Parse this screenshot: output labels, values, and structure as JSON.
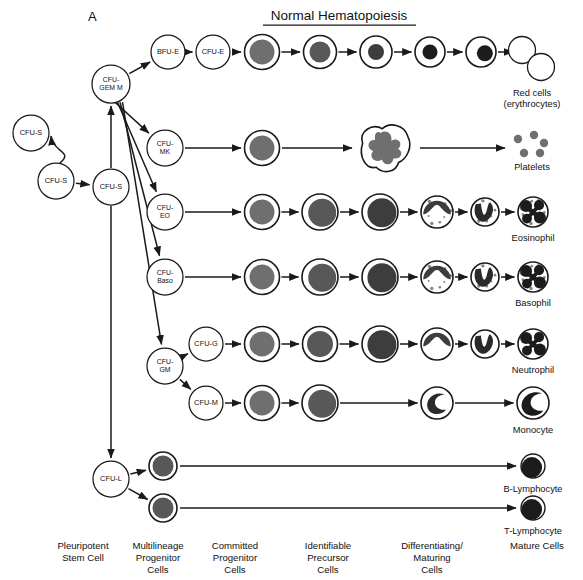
{
  "panel": {
    "tag": "A",
    "title": "Normal Hematopoiesis"
  },
  "colors": {
    "ink": "#1a1a1a",
    "nucleus_light": "#6f6f6f",
    "nucleus_mid": "#585858",
    "nucleus_dark": "#3d3d3d",
    "nucleus_darker": "#2a2a2a",
    "nucleus_black": "#1c1c1c",
    "cytoplasm": "#ffffff",
    "platelet": "#6f6f6f"
  },
  "column_labels": [
    {
      "id": "pleuripotent",
      "lines": [
        "Pleuripotent",
        "Stem Cell"
      ],
      "x": 83
    },
    {
      "id": "multilineage",
      "lines": [
        "Multilineage",
        "Progenitor",
        "Cells"
      ],
      "x": 158
    },
    {
      "id": "committed",
      "lines": [
        "Committed",
        "Progenitor",
        "Cells"
      ],
      "x": 235
    },
    {
      "id": "identifiable",
      "lines": [
        "Identifiable",
        "Precursor",
        "Cells"
      ],
      "x": 328
    },
    {
      "id": "differentiating",
      "lines": [
        "Differentiating/",
        "Maturing",
        "Cells"
      ],
      "x": 432
    },
    {
      "id": "mature",
      "lines": [
        "Mature Cells"
      ],
      "x": 537
    }
  ],
  "progenitor_nodes": [
    {
      "id": "cfu-s-renew",
      "lines": [
        "CFU-S"
      ],
      "cx": 31,
      "cy": 133,
      "r": 18
    },
    {
      "id": "cfu-s-mid",
      "lines": [
        "CFU-S"
      ],
      "cx": 56,
      "cy": 181,
      "r": 18
    },
    {
      "id": "cfu-s-main",
      "lines": [
        "CFU-S"
      ],
      "cx": 111,
      "cy": 187,
      "r": 18
    },
    {
      "id": "cfu-gemm",
      "lines": [
        "CFU-",
        "GEM M"
      ],
      "cx": 111,
      "cy": 84,
      "r": 19
    },
    {
      "id": "bfu-e",
      "lines": [
        "BFU-E"
      ],
      "cx": 168,
      "cy": 52,
      "r": 17
    },
    {
      "id": "cfu-e",
      "lines": [
        "CFU-E"
      ],
      "cx": 213,
      "cy": 52,
      "r": 17
    },
    {
      "id": "cfu-mk",
      "lines": [
        "CFU-",
        "MK"
      ],
      "cx": 165,
      "cy": 148,
      "r": 18
    },
    {
      "id": "cfu-eo",
      "lines": [
        "CFU-",
        "EO"
      ],
      "cx": 165,
      "cy": 212,
      "r": 18
    },
    {
      "id": "cfu-baso",
      "lines": [
        "CFU-",
        "Baso"
      ],
      "cx": 165,
      "cy": 277,
      "r": 18
    },
    {
      "id": "cfu-gm",
      "lines": [
        "CFU-",
        "GM"
      ],
      "cx": 165,
      "cy": 366,
      "r": 18
    },
    {
      "id": "cfu-g",
      "lines": [
        "CFU-G"
      ],
      "cx": 206,
      "cy": 344,
      "r": 17
    },
    {
      "id": "cfu-m",
      "lines": [
        "CFU-M"
      ],
      "cx": 206,
      "cy": 403,
      "r": 17
    },
    {
      "id": "cfu-l",
      "lines": [
        "CFU-L"
      ],
      "cx": 111,
      "cy": 479,
      "r": 18
    }
  ],
  "lineages": [
    {
      "id": "erythroid",
      "name": "Erythroid",
      "end_label": [
        "Red cells",
        "(erythrocytes)"
      ],
      "row_y": 52,
      "cells": [
        {
          "id": "proerythroblast",
          "cx": 262,
          "cy": 52,
          "r": 17.5,
          "nucleus_r": 12.5,
          "tone": "nucleus_light"
        },
        {
          "id": "basophilic-erythroblast",
          "cx": 320,
          "cy": 52,
          "r": 16.5,
          "nucleus_r": 10.5,
          "tone": "nucleus_mid"
        },
        {
          "id": "polychromatic-erythroblast",
          "cx": 376,
          "cy": 52,
          "r": 16,
          "nucleus_r": 8,
          "tone": "nucleus_dark"
        },
        {
          "id": "orthochromatic-erythroblast",
          "cx": 430,
          "cy": 52,
          "r": 15,
          "nucleus_r": 7.5,
          "tone": "nucleus_black"
        },
        {
          "id": "reticulocyte",
          "cx": 481,
          "cy": 52,
          "r": 15,
          "nucleus_r": 8,
          "tone": "nucleus_black",
          "eccentric": true
        }
      ],
      "mature": {
        "id": "erythrocytes",
        "type": "rbc-pair",
        "cx": 532,
        "cy": 58,
        "label_y": 96
      }
    },
    {
      "id": "megakaryocytic",
      "name": "Megakaryocytic",
      "end_label": [
        "Platelets"
      ],
      "row_y": 148,
      "cells": [
        {
          "id": "megakaryoblast",
          "cx": 262,
          "cy": 148,
          "r": 17.5,
          "nucleus_r": 12.5,
          "tone": "nucleus_light"
        },
        {
          "id": "megakaryocyte",
          "cx": 385,
          "cy": 148,
          "type": "megakaryocyte"
        }
      ],
      "mature": {
        "id": "platelets",
        "type": "platelets",
        "cx": 532,
        "cy": 145,
        "label_y": 170
      }
    },
    {
      "id": "eosinophilic",
      "name": "Eosinophilic",
      "end_label": [
        "Eosinophil"
      ],
      "row_y": 212,
      "cells": [
        {
          "id": "eo-myeloblast",
          "cx": 262,
          "cy": 212,
          "r": 17.5,
          "nucleus_r": 12.5,
          "tone": "nucleus_light"
        },
        {
          "id": "eo-promyelocyte",
          "cx": 320,
          "cy": 212,
          "r": 18,
          "nucleus_r": 14,
          "tone": "nucleus_mid",
          "eccentric": true
        },
        {
          "id": "eo-myelocyte",
          "cx": 380,
          "cy": 212,
          "r": 18,
          "nucleus_r": 14.5,
          "tone": "nucleus_dark",
          "eccentric": true
        },
        {
          "id": "eo-metamyelocyte",
          "cx": 437,
          "cy": 212,
          "r": 16,
          "type": "indented",
          "tone": "nucleus_dark",
          "granules": true
        },
        {
          "id": "eo-band",
          "cx": 485,
          "cy": 212,
          "r": 14,
          "type": "band",
          "tone": "nucleus_darker",
          "granules": true
        }
      ],
      "mature": {
        "id": "eosinophil",
        "type": "segmented",
        "cx": 533,
        "cy": 212,
        "r": 15,
        "granules": true,
        "label_y": 241
      }
    },
    {
      "id": "basophilic",
      "name": "Basophilic",
      "end_label": [
        "Basophil"
      ],
      "row_y": 277,
      "cells": [
        {
          "id": "baso-myeloblast",
          "cx": 262,
          "cy": 277,
          "r": 17.5,
          "nucleus_r": 12.5,
          "tone": "nucleus_light"
        },
        {
          "id": "baso-promyelocyte",
          "cx": 320,
          "cy": 277,
          "r": 18,
          "nucleus_r": 14,
          "tone": "nucleus_mid",
          "eccentric": true
        },
        {
          "id": "baso-myelocyte",
          "cx": 380,
          "cy": 277,
          "r": 18,
          "nucleus_r": 14.5,
          "tone": "nucleus_dark",
          "eccentric": true
        },
        {
          "id": "baso-metamyelocyte",
          "cx": 437,
          "cy": 277,
          "r": 16,
          "type": "indented",
          "tone": "nucleus_dark",
          "granules": true
        },
        {
          "id": "baso-band",
          "cx": 485,
          "cy": 277,
          "r": 14,
          "type": "band",
          "tone": "nucleus_darker",
          "granules": true
        }
      ],
      "mature": {
        "id": "basophil",
        "type": "segmented",
        "cx": 533,
        "cy": 277,
        "r": 15,
        "granules": true,
        "label_y": 306
      }
    },
    {
      "id": "neutrophilic",
      "name": "Neutrophilic",
      "end_label": [
        "Neutrophil"
      ],
      "row_y": 344,
      "cells": [
        {
          "id": "neut-myeloblast",
          "cx": 262,
          "cy": 344,
          "r": 17.5,
          "nucleus_r": 12.5,
          "tone": "nucleus_light"
        },
        {
          "id": "neut-promyelocyte",
          "cx": 320,
          "cy": 344,
          "r": 17.5,
          "nucleus_r": 13,
          "tone": "nucleus_mid"
        },
        {
          "id": "neut-myelocyte",
          "cx": 380,
          "cy": 344,
          "r": 18,
          "nucleus_r": 14.5,
          "tone": "nucleus_dark",
          "eccentric": true
        },
        {
          "id": "neut-metamyelocyte",
          "cx": 437,
          "cy": 344,
          "r": 16,
          "type": "indented",
          "tone": "nucleus_dark"
        },
        {
          "id": "neut-band",
          "cx": 485,
          "cy": 344,
          "r": 14,
          "type": "band",
          "tone": "nucleus_darker"
        }
      ],
      "mature": {
        "id": "neutrophil",
        "type": "segmented",
        "cx": 533,
        "cy": 344,
        "r": 15,
        "granules": false,
        "label_y": 373
      }
    },
    {
      "id": "monocytic",
      "name": "Monocytic",
      "end_label": [
        "Monocyte"
      ],
      "row_y": 403,
      "cells": [
        {
          "id": "monoblast",
          "cx": 262,
          "cy": 403,
          "r": 17.5,
          "nucleus_r": 12.5,
          "tone": "nucleus_light"
        },
        {
          "id": "promonocyte",
          "cx": 320,
          "cy": 403,
          "r": 18,
          "nucleus_r": 14,
          "tone": "nucleus_mid",
          "eccentric": true
        },
        {
          "id": "immature-monocyte",
          "cx": 437,
          "cy": 403,
          "r": 16,
          "type": "kidney",
          "tone": "nucleus_darker"
        }
      ],
      "mature": {
        "id": "monocyte",
        "type": "kidney-mature",
        "cx": 533,
        "cy": 403,
        "r": 16,
        "label_y": 433
      }
    },
    {
      "id": "b-lymphoid",
      "name": "B-lymphoid",
      "end_label": [
        "B-Lymphocyte"
      ],
      "row_y": 466,
      "cells": [
        {
          "id": "b-lymphoblast",
          "cx": 163,
          "cy": 466,
          "r": 14,
          "nucleus_r": 10.5,
          "tone": "nucleus_mid"
        }
      ],
      "mature": {
        "id": "b-lymphocyte",
        "type": "lymphocyte",
        "cx": 533,
        "cy": 466,
        "r": 12,
        "label_y": 492
      }
    },
    {
      "id": "t-lymphoid",
      "name": "T-lymphoid",
      "end_label": [
        "T-Lymphocyte"
      ],
      "row_y": 508,
      "cells": [
        {
          "id": "t-lymphoblast",
          "cx": 163,
          "cy": 508,
          "r": 14,
          "nucleus_r": 10.5,
          "tone": "nucleus_mid"
        }
      ],
      "mature": {
        "id": "t-lymphocyte",
        "type": "lymphocyte",
        "cx": 533,
        "cy": 508,
        "r": 12,
        "label_y": 534
      }
    }
  ]
}
